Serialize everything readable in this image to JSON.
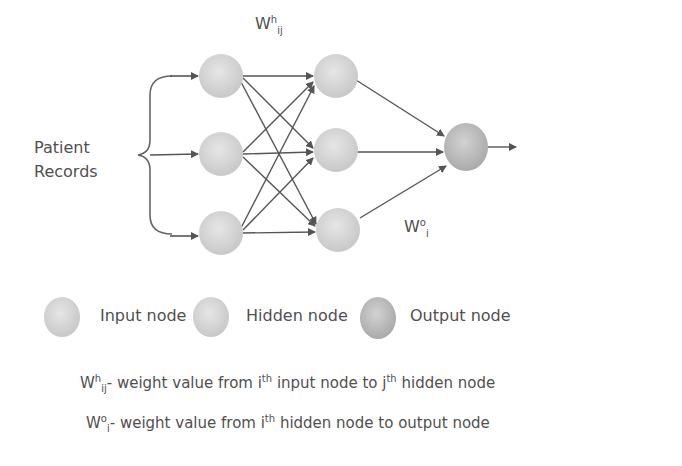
{
  "diagram": {
    "title_weight_hidden": {
      "base": "W",
      "sup": "h",
      "sub": "ij"
    },
    "title_weight_output": {
      "base": "W",
      "sup": "o",
      "sub": "i"
    },
    "input_label_line1": "Patient",
    "input_label_line2": "Records",
    "layers": {
      "input": 3,
      "hidden": 3,
      "output": 1
    },
    "colors": {
      "input_node": "#d8d8d8",
      "hidden_node": "#d4d4d4",
      "output_node": "#c2c2c2",
      "edge": "#555555"
    }
  },
  "legend": {
    "items": [
      {
        "label": "Input node"
      },
      {
        "label": "Hidden node"
      },
      {
        "label": "Output node"
      }
    ]
  },
  "definitions": [
    {
      "base": "W",
      "sup": "h",
      "sub": "ij",
      "text1": "- weight value from i",
      "sup2": "th",
      "text2": " input node to j",
      "sup3": "th",
      "text3": " hidden node"
    },
    {
      "base": "W",
      "sup": "o",
      "sub": "i",
      "text1": "- weight value from i",
      "sup2": "th",
      "text2": " hidden node to output node"
    }
  ]
}
